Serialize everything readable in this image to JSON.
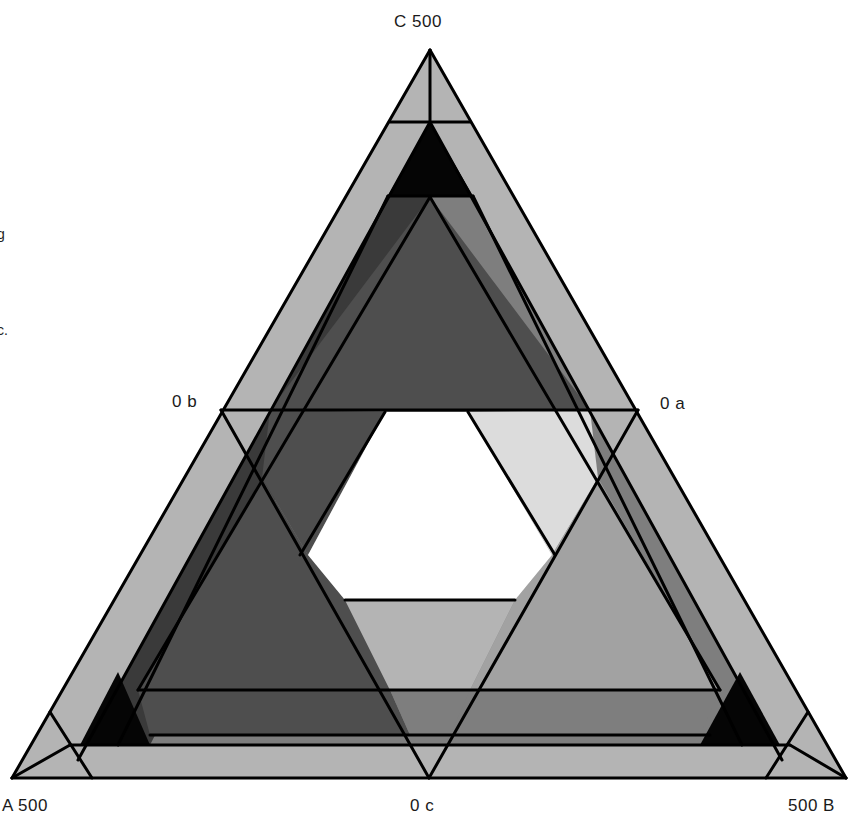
{
  "figure": {
    "type": "ternary-region-diagram",
    "labels": {
      "top_vertex": "C 500",
      "left_vertex": "A 500",
      "right_vertex": "500 B",
      "left_mid": "0 b",
      "right_mid": "0 a",
      "bottom_mid": "0 c"
    },
    "cropped_side_text": [
      "g",
      "c."
    ],
    "colors": {
      "lightest": "#dcdcdc",
      "light": "#b4b4b4",
      "mid_light": "#a2a2a2",
      "mid": "#7e7e7e",
      "mid_dark": "#6a6a6a",
      "dark": "#4e4e4e",
      "darker": "#3a3a3a",
      "black": "#050505",
      "white": "#ffffff",
      "line": "#000000"
    },
    "regions": [
      {
        "name": "outer-band",
        "fill": "light",
        "points": "12,778 846,778 430,50"
      },
      {
        "name": "inner-triangle-base",
        "fill": "mid",
        "points": "78,760 782,760 430,122"
      },
      {
        "name": "left-dark-band",
        "fill": "darker",
        "points": "78,760 150,745 430,196 388,196 430,122"
      },
      {
        "name": "right-mid-band",
        "fill": "mid",
        "points": "782,760 700,745 430,196 473,196 430,122"
      },
      {
        "name": "top-central-triangle",
        "fill": "dark",
        "points": "430,197 590,410 270,410"
      },
      {
        "name": "left-upper-strip",
        "fill": "dark",
        "points": "270,410 385,412 308,555 262,478"
      },
      {
        "name": "right-upper-strip",
        "fill": "lightest",
        "points": "468,412 590,410 598,478 552,555"
      },
      {
        "name": "left-lower-triangle",
        "fill": "dark",
        "points": "262,478 308,555 345,600 390,690 138,690"
      },
      {
        "name": "right-lower-triangle",
        "fill": "mid_light",
        "points": "598,478 720,690 470,690 515,600 552,555"
      },
      {
        "name": "bottom-center-strip",
        "fill": "light",
        "points": "345,600 515,600 470,690 390,690"
      },
      {
        "name": "bottom-dark-band-left",
        "fill": "dark",
        "points": "138,690 390,690 410,735 150,735"
      },
      {
        "name": "bottom-mid-band-right",
        "fill": "mid",
        "points": "450,735 470,690 720,690 700,735"
      },
      {
        "name": "bottom-center-mid",
        "fill": "mid",
        "points": "390,690 470,690 450,735 410,735"
      },
      {
        "name": "bottom-light-band",
        "fill": "light",
        "points": "78,745 782,745 790,772 70,772"
      },
      {
        "name": "hexagon-void",
        "fill": "white",
        "points": "385,412 468,412 552,555 515,600 345,600 308,555"
      },
      {
        "name": "top-black-corner",
        "fill": "black",
        "points": "388,196 473,196 430,122"
      },
      {
        "name": "left-black-corner",
        "fill": "black",
        "points": "80,745 150,745 118,672"
      },
      {
        "name": "right-black-corner",
        "fill": "black",
        "points": "700,745 780,745 740,672"
      }
    ],
    "lines": [
      {
        "name": "outer-edge-left",
        "x1": 12,
        "y1": 778,
        "x2": 430,
        "y2": 50
      },
      {
        "name": "outer-edge-right",
        "x1": 846,
        "y1": 778,
        "x2": 430,
        "y2": 50
      },
      {
        "name": "outer-edge-bottom",
        "x1": 12,
        "y1": 778,
        "x2": 846,
        "y2": 778
      },
      {
        "name": "c-axis",
        "x1": 430,
        "y1": 50,
        "x2": 430,
        "y2": 122
      },
      {
        "name": "top-cut",
        "x1": 390,
        "y1": 122,
        "x2": 470,
        "y2": 122
      },
      {
        "name": "a-axis",
        "x1": 12,
        "y1": 778,
        "x2": 70,
        "y2": 745
      },
      {
        "name": "left-cut",
        "x1": 50,
        "y1": 712,
        "x2": 92,
        "y2": 778
      },
      {
        "name": "b-axis",
        "x1": 846,
        "y1": 778,
        "x2": 790,
        "y2": 745
      },
      {
        "name": "right-cut",
        "x1": 808,
        "y1": 712,
        "x2": 766,
        "y2": 778
      },
      {
        "name": "mid-horizontal",
        "x1": 221,
        "y1": 410,
        "x2": 638,
        "y2": 410
      },
      {
        "name": "medial-left",
        "x1": 221,
        "y1": 410,
        "x2": 429,
        "y2": 778
      },
      {
        "name": "medial-right",
        "x1": 638,
        "y1": 410,
        "x2": 429,
        "y2": 778
      },
      {
        "name": "band-line-l1",
        "x1": 78,
        "y1": 760,
        "x2": 430,
        "y2": 122
      },
      {
        "name": "band-line-r1",
        "x1": 782,
        "y1": 760,
        "x2": 430,
        "y2": 122
      },
      {
        "name": "band-line-l2",
        "x1": 118,
        "y1": 745,
        "x2": 388,
        "y2": 196
      },
      {
        "name": "band-line-r2",
        "x1": 742,
        "y1": 745,
        "x2": 473,
        "y2": 196
      },
      {
        "name": "band-line-l3",
        "x1": 138,
        "y1": 690,
        "x2": 430,
        "y2": 197
      },
      {
        "name": "band-line-r3",
        "x1": 720,
        "y1": 690,
        "x2": 430,
        "y2": 197
      },
      {
        "name": "bottom-line-1",
        "x1": 70,
        "y1": 745,
        "x2": 790,
        "y2": 745
      },
      {
        "name": "bottom-line-2",
        "x1": 150,
        "y1": 735,
        "x2": 710,
        "y2": 735
      },
      {
        "name": "bottom-line-3",
        "x1": 138,
        "y1": 690,
        "x2": 720,
        "y2": 690
      },
      {
        "name": "top-line-196",
        "x1": 388,
        "y1": 196,
        "x2": 473,
        "y2": 196
      },
      {
        "name": "hex-left-upper",
        "x1": 385,
        "y1": 412,
        "x2": 300,
        "y2": 555
      },
      {
        "name": "hex-right-upper",
        "x1": 468,
        "y1": 412,
        "x2": 555,
        "y2": 555
      },
      {
        "name": "hex-bottom",
        "x1": 345,
        "y1": 600,
        "x2": 515,
        "y2": 600
      }
    ]
  }
}
